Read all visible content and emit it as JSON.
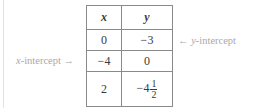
{
  "table": {
    "headers": [
      "x",
      "y"
    ],
    "rows": [
      {
        "x": "0",
        "y": "−3"
      },
      {
        "x": "−4",
        "y": "0"
      },
      {
        "x": "2",
        "y_whole": "−4",
        "y_num": "1",
        "y_den": "2"
      }
    ]
  },
  "annotations": {
    "y_intercept": {
      "arrow": "←",
      "var": "y",
      "text": "-intercept"
    },
    "x_intercept": {
      "var": "x",
      "text": "-intercept",
      "arrow": "→"
    }
  },
  "colors": {
    "border": "#6e6e6e",
    "text": "#3a3a3a",
    "annotation": "#a9a9a9"
  }
}
